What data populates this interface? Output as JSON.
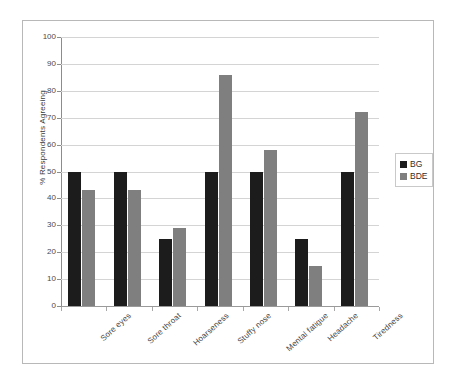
{
  "chart_data": {
    "type": "bar",
    "title": "",
    "subtitle": "",
    "xlabel": "",
    "ylabel": "% Respondents Agreeing",
    "ylim": [
      0,
      100
    ],
    "ytick_step": 10,
    "yticks": [
      0,
      10,
      20,
      30,
      40,
      50,
      60,
      70,
      80,
      90,
      100
    ],
    "ytick_labels": [
      "0",
      "10",
      "20",
      "30",
      "40",
      "50",
      "60",
      "70",
      "80",
      "90",
      "100"
    ],
    "grid": true,
    "grid_axis": "y",
    "legend_position": "right",
    "categories": [
      "Sore eyes",
      "Sore throat",
      "Hoarseness",
      "Stuffy nose",
      "Mental fatigue",
      "Headache",
      "Tiredness"
    ],
    "series": [
      {
        "name": "BG",
        "color": "#1c1c1c",
        "values": [
          50,
          50,
          25,
          50,
          50,
          25,
          50
        ]
      },
      {
        "name": "BDE",
        "color": "#7f7f7f",
        "values": [
          43,
          43,
          29,
          86,
          58,
          15,
          72
        ]
      }
    ]
  },
  "legend": {
    "entries": [
      {
        "label": "BG",
        "swatch": "black-square-swatch"
      },
      {
        "label": "BDE",
        "swatch": "gray-square-swatch"
      }
    ]
  },
  "axes": {
    "y_title": "% Respondents Agreeing"
  }
}
